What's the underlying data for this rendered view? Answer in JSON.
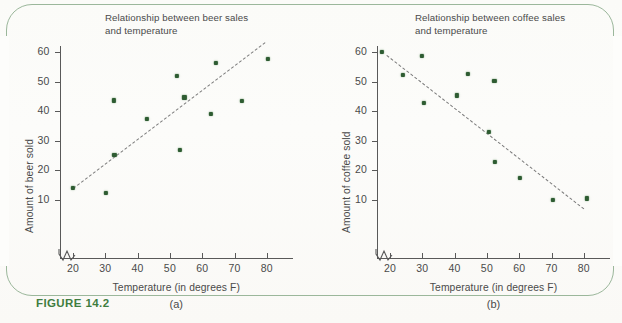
{
  "figure": {
    "caption": "FIGURE 14.2",
    "caption_color": "#3f7d3f",
    "frame_color": "#9bb79b",
    "background": "#fdfdfb",
    "dot_color": "#2e5c32",
    "trendline_color": "#7a7a7a",
    "axis_color": "#595959"
  },
  "charts": [
    {
      "id": "beer",
      "panel_label": "(a)",
      "title": "Relationship between beer sales\nand temperature",
      "xlabel": "Temperature (in degrees F)",
      "ylabel": "Amount of beer sold",
      "xticks": [
        20,
        30,
        40,
        50,
        60,
        70,
        80
      ],
      "yticks": [
        10,
        20,
        30,
        40,
        50,
        60
      ],
      "axis_break": true
    },
    {
      "id": "coffee",
      "panel_label": "(b)",
      "title": "Relationship between coffee sales\nand temperature",
      "xlabel": "Temperature (in degrees F)",
      "ylabel": "Amount of coffee sold",
      "xticks": [
        20,
        30,
        40,
        50,
        60,
        70,
        80
      ],
      "yticks": [
        10,
        20,
        30,
        40,
        50,
        60
      ],
      "axis_break": true
    }
  ],
  "chart_data": [
    {
      "type": "scatter",
      "id": "beer",
      "title": "Relationship between beer sales and temperature",
      "subtitle": "(a)",
      "xlabel": "Temperature (in degrees F)",
      "ylabel": "Amount of beer sold",
      "xlim": [
        17,
        88
      ],
      "ylim": [
        0,
        65
      ],
      "xticks": [
        20,
        30,
        40,
        50,
        60,
        70,
        80
      ],
      "yticks": [
        10,
        20,
        30,
        40,
        50,
        60
      ],
      "grid": false,
      "legend": false,
      "axis_break_x": true,
      "points": [
        {
          "x": 20.0,
          "y": 14.0
        },
        {
          "x": 30.2,
          "y": 12.3
        },
        {
          "x": 32.6,
          "y": 43.6
        },
        {
          "x": 32.8,
          "y": 25.2
        },
        {
          "x": 43.0,
          "y": 37.3
        },
        {
          "x": 52.1,
          "y": 51.8
        },
        {
          "x": 53.2,
          "y": 26.8
        },
        {
          "x": 54.5,
          "y": 44.6
        },
        {
          "x": 62.6,
          "y": 39.0
        },
        {
          "x": 64.3,
          "y": 56.2
        },
        {
          "x": 72.2,
          "y": 43.4
        },
        {
          "x": 80.3,
          "y": 57.6
        }
      ],
      "trendline": {
        "style": "dashed",
        "x0": 20.0,
        "y0": 14.0,
        "x1": 79.5,
        "y1": 63.5
      }
    },
    {
      "type": "scatter",
      "id": "coffee",
      "title": "Relationship between coffee sales and temperature",
      "subtitle": "(b)",
      "xlabel": "Temperature (in degrees F)",
      "ylabel": "Amount of coffee sold",
      "xlim": [
        15,
        88
      ],
      "ylim": [
        0,
        65
      ],
      "xticks": [
        20,
        30,
        40,
        50,
        60,
        70,
        80
      ],
      "yticks": [
        10,
        20,
        30,
        40,
        50,
        60
      ],
      "grid": false,
      "legend": false,
      "axis_break_x": true,
      "points": [
        {
          "x": 17.6,
          "y": 60.0
        },
        {
          "x": 23.9,
          "y": 52.3
        },
        {
          "x": 30.0,
          "y": 58.8
        },
        {
          "x": 30.6,
          "y": 42.7
        },
        {
          "x": 40.8,
          "y": 45.3
        },
        {
          "x": 44.0,
          "y": 52.5
        },
        {
          "x": 50.6,
          "y": 33.0
        },
        {
          "x": 52.3,
          "y": 50.3
        },
        {
          "x": 52.6,
          "y": 22.7
        },
        {
          "x": 60.2,
          "y": 17.2
        },
        {
          "x": 70.5,
          "y": 9.9
        },
        {
          "x": 81.0,
          "y": 10.4
        }
      ],
      "trendline": {
        "style": "dashed",
        "x0": 19.0,
        "y0": 59.0,
        "x1": 80.0,
        "y1": 7.0
      }
    }
  ]
}
